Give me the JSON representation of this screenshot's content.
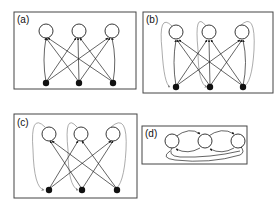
{
  "figure": {
    "panels": [
      {
        "id": "a",
        "label": "(a)",
        "description": "Bipartite network: 3 filled nodes each connect to all 3 open nodes"
      },
      {
        "id": "b",
        "label": "(b)",
        "description": "Bipartite network with feedback loops from open nodes back to filled nodes"
      },
      {
        "id": "c",
        "label": "(c)",
        "description": "Cross connections only (no vertical edges) with feedback loops"
      },
      {
        "id": "d",
        "label": "(d)",
        "description": "Three open nodes in a chain with bidirectional and skip connections"
      }
    ]
  },
  "colors": {
    "edge": "#222222",
    "loop": "#888888",
    "border": "#444444",
    "filled_node": "#111111"
  }
}
